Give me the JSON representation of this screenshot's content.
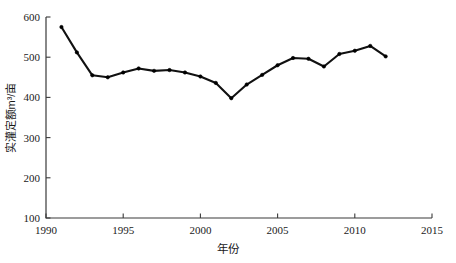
{
  "chart_data": {
    "type": "line",
    "title": "",
    "xlabel": "年份",
    "ylabel": "实灌定额m³/亩",
    "xlim": [
      1990,
      2015
    ],
    "ylim": [
      100,
      600
    ],
    "xticks": [
      1990,
      1995,
      2000,
      2005,
      2010,
      2015
    ],
    "yticks": [
      100,
      200,
      300,
      400,
      500,
      600
    ],
    "grid": false,
    "legend": null,
    "marker": "filled-circle",
    "line_color": "#111111",
    "x": [
      1991,
      1992,
      1993,
      1994,
      1995,
      1996,
      1997,
      1998,
      1999,
      2000,
      2001,
      2002,
      2003,
      2004,
      2005,
      2006,
      2007,
      2008,
      2009,
      2010,
      2011,
      2012
    ],
    "values": [
      575,
      512,
      455,
      450,
      462,
      472,
      466,
      468,
      462,
      452,
      436,
      398,
      432,
      456,
      480,
      498,
      496,
      477,
      508,
      516,
      528,
      502
    ],
    "series": [
      {
        "name": "实灌定额",
        "values": [
          575,
          512,
          455,
          450,
          462,
          472,
          466,
          468,
          462,
          452,
          436,
          398,
          432,
          456,
          480,
          498,
          496,
          477,
          508,
          516,
          528,
          502
        ]
      }
    ]
  },
  "axes": {
    "x_tick_labels": [
      "1990",
      "1995",
      "2000",
      "2005",
      "2010",
      "2015"
    ],
    "y_tick_labels": [
      "100",
      "200",
      "300",
      "400",
      "500",
      "600"
    ]
  }
}
